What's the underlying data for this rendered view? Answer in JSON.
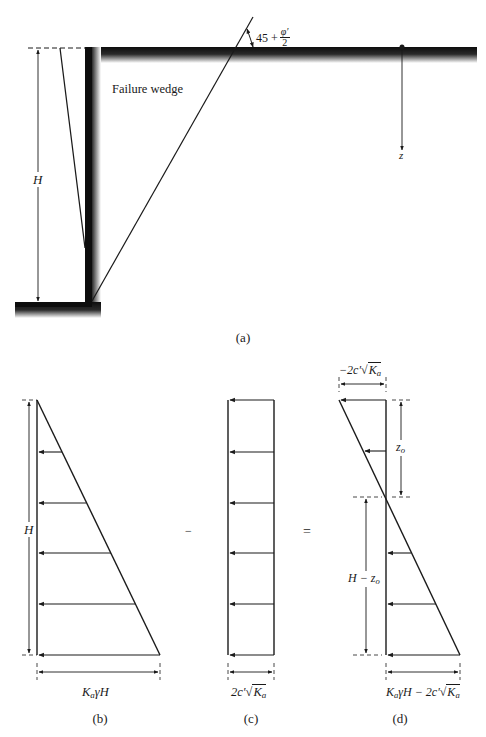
{
  "figure": {
    "panels": {
      "a": {
        "label": "(a)",
        "failure_wedge_text": "Failure wedge",
        "height_label": "H",
        "angle_label": {
          "prefix": "45 + ",
          "numerator": "φ′",
          "denominator": "2"
        },
        "depth_axis_label": "z"
      },
      "b": {
        "label": "(b)",
        "height_label": "H",
        "base_label": {
          "k": "K",
          "sub": "a",
          "rest": "γH"
        }
      },
      "c": {
        "label": "(c)",
        "base_label": {
          "prefix": "2c′√",
          "k": "K",
          "sub": "a"
        }
      },
      "d": {
        "label": "(d)",
        "top_label": {
          "prefix": "−2c′√",
          "k": "K",
          "sub": "a"
        },
        "zo_label": {
          "z": "z",
          "sub": "o"
        },
        "h_minus_zo_label": {
          "h": "H − z",
          "sub": "o"
        },
        "base_label": {
          "k": "K",
          "sub": "a",
          "rest": "γH − 2c′√",
          "k2": "K",
          "sub2": "a"
        }
      }
    },
    "operators": {
      "minus": "−",
      "equals": "="
    },
    "colors": {
      "ink": "#1a1a1a",
      "wall": "#111111",
      "background": "#ffffff"
    }
  }
}
